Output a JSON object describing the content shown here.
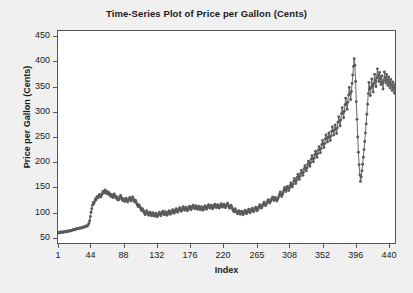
{
  "chart_data": {
    "type": "line",
    "title": "Time-Series Plot of Price per Gallon (Cents)",
    "xlabel": "Index",
    "ylabel": "Price per Gallon (Cents)",
    "xlim": [
      1,
      448
    ],
    "ylim": [
      40,
      460
    ],
    "yticks": [
      50,
      100,
      150,
      200,
      250,
      300,
      350,
      400,
      450
    ],
    "xticks": [
      1,
      44,
      88,
      132,
      176,
      220,
      265,
      308,
      352,
      396,
      440
    ],
    "grid": false,
    "legend": null,
    "marker": "filled-circle",
    "line_color": "#5a5a5a",
    "marker_color": "#5a5a5a",
    "background_color": "#f0f0f0",
    "plot_background_color": "#ffffff",
    "axis_color": "#555555",
    "series": [
      {
        "name": "Price per Gallon (Cents)",
        "values": [
          61,
          60,
          60,
          61,
          62,
          62,
          61,
          61,
          62,
          63,
          62,
          62,
          63,
          64,
          63,
          63,
          64,
          65,
          65,
          64,
          65,
          66,
          67,
          67,
          66,
          67,
          68,
          69,
          68,
          68,
          69,
          70,
          70,
          69,
          70,
          71,
          72,
          71,
          72,
          73,
          74,
          73,
          74,
          76,
          79,
          84,
          92,
          101,
          108,
          115,
          120,
          118,
          122,
          127,
          125,
          130,
          132,
          129,
          133,
          136,
          134,
          131,
          135,
          138,
          142,
          139,
          143,
          145,
          141,
          138,
          142,
          140,
          136,
          139,
          135,
          132,
          136,
          133,
          130,
          134,
          137,
          133,
          129,
          132,
          128,
          125,
          129,
          126,
          131,
          134,
          130,
          127,
          124,
          128,
          125,
          122,
          126,
          129,
          125,
          121,
          124,
          127,
          130,
          126,
          123,
          127,
          131,
          128,
          124,
          121,
          125,
          122,
          118,
          115,
          112,
          116,
          113,
          110,
          107,
          104,
          108,
          105,
          102,
          99,
          96,
          100,
          104,
          101,
          98,
          95,
          98,
          101,
          97,
          94,
          97,
          100,
          96,
          93,
          96,
          99,
          95,
          92,
          95,
          98,
          101,
          97,
          94,
          97,
          100,
          103,
          99,
          96,
          99,
          102,
          98,
          95,
          98,
          101,
          104,
          100,
          97,
          100,
          103,
          106,
          102,
          99,
          102,
          105,
          108,
          104,
          101,
          104,
          107,
          110,
          106,
          103,
          106,
          109,
          112,
          108,
          105,
          108,
          111,
          107,
          104,
          107,
          110,
          113,
          109,
          106,
          109,
          112,
          115,
          111,
          108,
          111,
          114,
          110,
          107,
          110,
          113,
          109,
          106,
          109,
          112,
          108,
          105,
          108,
          111,
          114,
          110,
          107,
          110,
          113,
          116,
          112,
          109,
          112,
          115,
          111,
          108,
          111,
          114,
          117,
          113,
          110,
          113,
          116,
          112,
          109,
          112,
          115,
          118,
          114,
          111,
          114,
          117,
          113,
          110,
          113,
          116,
          119,
          115,
          112,
          109,
          112,
          115,
          111,
          108,
          105,
          102,
          105,
          108,
          104,
          101,
          98,
          101,
          104,
          100,
          97,
          100,
          103,
          99,
          96,
          99,
          102,
          105,
          101,
          98,
          101,
          104,
          107,
          103,
          100,
          103,
          106,
          109,
          105,
          102,
          105,
          108,
          111,
          107,
          104,
          107,
          110,
          113,
          116,
          112,
          109,
          112,
          115,
          118,
          121,
          117,
          114,
          117,
          120,
          123,
          126,
          122,
          119,
          122,
          125,
          128,
          131,
          127,
          124,
          127,
          130,
          126,
          123,
          126,
          129,
          133,
          137,
          141,
          136,
          132,
          136,
          140,
          145,
          150,
          146,
          142,
          147,
          152,
          148,
          144,
          149,
          154,
          159,
          155,
          151,
          156,
          162,
          168,
          163,
          158,
          164,
          170,
          176,
          171,
          166,
          172,
          178,
          184,
          179,
          174,
          180,
          187,
          193,
          188,
          183,
          189,
          196,
          202,
          197,
          192,
          199,
          206,
          213,
          207,
          201,
          208,
          215,
          222,
          216,
          210,
          217,
          224,
          231,
          225,
          219,
          227,
          235,
          243,
          236,
          229,
          237,
          246,
          254,
          247,
          240,
          249,
          258,
          250,
          243,
          252,
          261,
          270,
          262,
          254,
          264,
          274,
          266,
          257,
          268,
          279,
          290,
          281,
          272,
          284,
          296,
          308,
          298,
          288,
          301,
          314,
          327,
          316,
          305,
          319,
          333,
          348,
          336,
          324,
          340,
          356,
          373,
          390,
          405,
          392,
          360,
          320,
          285,
          250,
          220,
          195,
          175,
          162,
          171,
          183,
          196,
          210,
          225,
          241,
          258,
          276,
          295,
          315,
          336,
          358,
          345,
          332,
          348,
          365,
          352,
          339,
          356,
          374,
          362,
          350,
          367,
          385,
          372,
          360,
          378,
          366,
          354,
          371,
          358,
          345,
          362,
          379,
          368,
          357,
          374,
          363,
          352,
          369,
          358,
          347,
          364,
          353,
          342,
          359,
          348,
          337,
          354
        ]
      }
    ]
  }
}
